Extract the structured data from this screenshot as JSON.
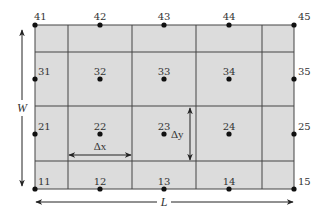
{
  "diagram": {
    "type": "finite-difference-grid",
    "colors": {
      "fill": "#dcdcdc",
      "grid_line": "#444444",
      "node": "#111111",
      "text": "#333333"
    },
    "grid": {
      "x0": 35,
      "y0": 25,
      "x1": 294,
      "y1": 189,
      "vertical_lines": [
        68,
        132,
        196,
        262
      ],
      "horizontal_lines": [
        52,
        106,
        161
      ]
    },
    "nodes": [
      {
        "id": "41",
        "x": 35,
        "y": 25,
        "lx": 34,
        "ly": 20,
        "anchor": "start"
      },
      {
        "id": "42",
        "x": 100,
        "y": 25,
        "lx": 100,
        "ly": 20,
        "anchor": "middle"
      },
      {
        "id": "43",
        "x": 164,
        "y": 25,
        "lx": 164,
        "ly": 20,
        "anchor": "middle"
      },
      {
        "id": "44",
        "x": 229,
        "y": 25,
        "lx": 229,
        "ly": 20,
        "anchor": "middle"
      },
      {
        "id": "45",
        "x": 294,
        "y": 25,
        "lx": 298,
        "ly": 20,
        "anchor": "start"
      },
      {
        "id": "31",
        "x": 35,
        "y": 79,
        "lx": 38,
        "ly": 75,
        "anchor": "start"
      },
      {
        "id": "32",
        "x": 100,
        "y": 79,
        "lx": 100,
        "ly": 75,
        "anchor": "middle"
      },
      {
        "id": "33",
        "x": 164,
        "y": 79,
        "lx": 164,
        "ly": 75,
        "anchor": "middle"
      },
      {
        "id": "34",
        "x": 229,
        "y": 79,
        "lx": 229,
        "ly": 75,
        "anchor": "middle"
      },
      {
        "id": "35",
        "x": 294,
        "y": 79,
        "lx": 298,
        "ly": 75,
        "anchor": "start"
      },
      {
        "id": "21",
        "x": 35,
        "y": 134,
        "lx": 38,
        "ly": 130,
        "anchor": "start"
      },
      {
        "id": "22",
        "x": 100,
        "y": 134,
        "lx": 100,
        "ly": 130,
        "anchor": "middle"
      },
      {
        "id": "23",
        "x": 164,
        "y": 134,
        "lx": 164,
        "ly": 130,
        "anchor": "middle"
      },
      {
        "id": "24",
        "x": 229,
        "y": 134,
        "lx": 229,
        "ly": 130,
        "anchor": "middle"
      },
      {
        "id": "25",
        "x": 294,
        "y": 134,
        "lx": 298,
        "ly": 130,
        "anchor": "start"
      },
      {
        "id": "11",
        "x": 35,
        "y": 189,
        "lx": 38,
        "ly": 185,
        "anchor": "start"
      },
      {
        "id": "12",
        "x": 100,
        "y": 189,
        "lx": 100,
        "ly": 185,
        "anchor": "middle"
      },
      {
        "id": "13",
        "x": 164,
        "y": 189,
        "lx": 164,
        "ly": 185,
        "anchor": "middle"
      },
      {
        "id": "14",
        "x": 229,
        "y": 189,
        "lx": 229,
        "ly": 185,
        "anchor": "middle"
      },
      {
        "id": "15",
        "x": 294,
        "y": 189,
        "lx": 298,
        "ly": 185,
        "anchor": "start"
      }
    ],
    "dimensions": {
      "width_label": "W",
      "length_label": "L",
      "dx_label": "Δx",
      "dy_label": "Δy"
    }
  }
}
